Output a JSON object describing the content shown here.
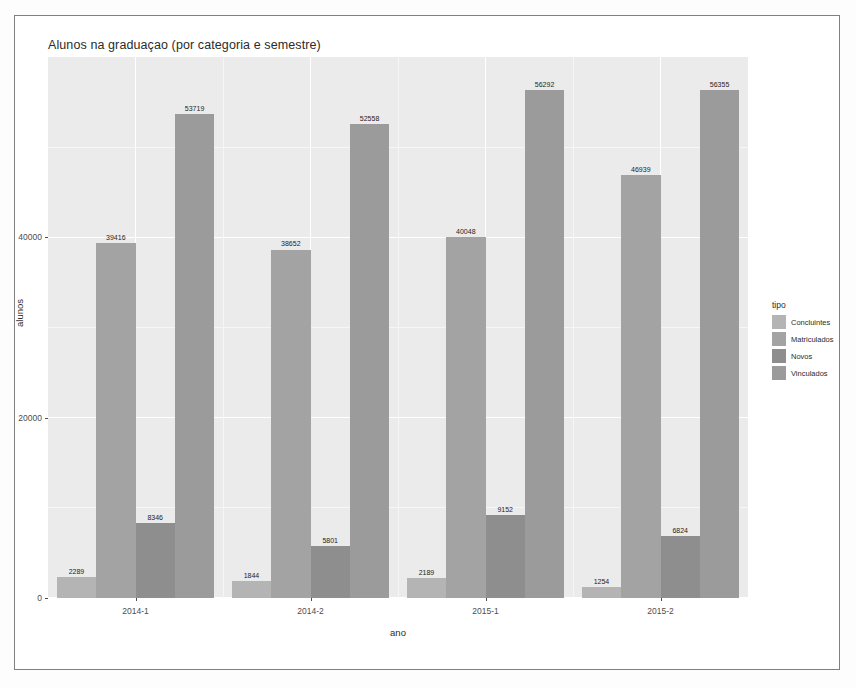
{
  "chart_data": {
    "type": "bar",
    "title": "Alunos na graduaçao (por categoria e semestre)",
    "xlabel": "ano",
    "ylabel": "alunos",
    "categories": [
      "2014-1",
      "2014-2",
      "2015-1",
      "2015-2"
    ],
    "ylim": [
      0,
      60000
    ],
    "yticks": [
      0,
      20000,
      40000
    ],
    "ytick_labels": [
      "0",
      "20000",
      "40000"
    ],
    "grid": true,
    "legend_position": "right",
    "legend_title": "tipo",
    "series": [
      {
        "name": "Concluintes",
        "color": "#b4b4b4",
        "values": [
          2289,
          1844,
          2189,
          1254
        ]
      },
      {
        "name": "Matriculados",
        "color": "#a3a3a3",
        "values": [
          39416,
          38652,
          40048,
          46939
        ]
      },
      {
        "name": "Novos",
        "color": "#8e8e8e",
        "values": [
          8346,
          5801,
          9152,
          6824
        ]
      },
      {
        "name": "Vinculados",
        "color": "#9b9b9b",
        "values": [
          53719,
          52558,
          56292,
          56355
        ]
      }
    ],
    "bar_labels": [
      [
        "2289",
        "39416",
        "8346",
        "53719"
      ],
      [
        "1844",
        "38652",
        "5801",
        "52558"
      ],
      [
        "2189",
        "40048",
        "9152",
        "56292"
      ],
      [
        "1254",
        "46939",
        "6824",
        "56355"
      ]
    ],
    "panel_background": "#ebebeb",
    "gridline_color": "#ffffff"
  }
}
